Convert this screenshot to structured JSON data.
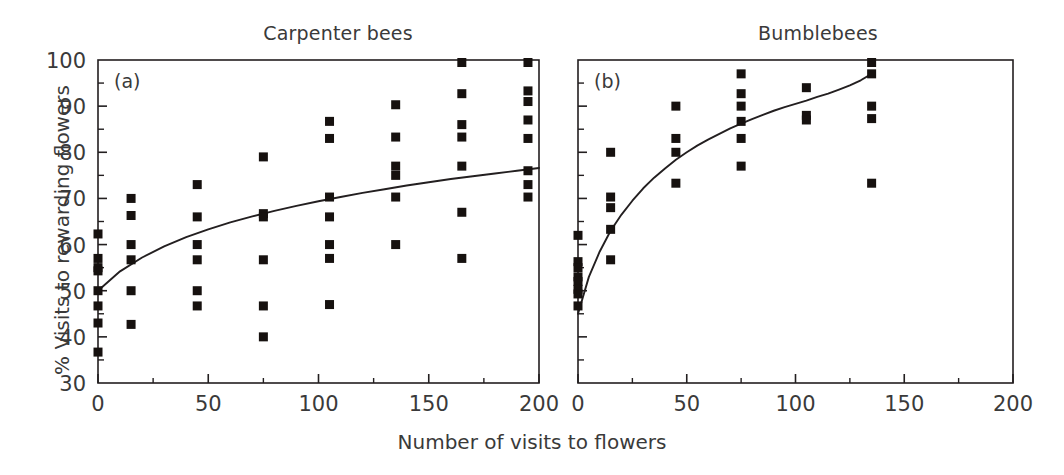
{
  "figure": {
    "xlabel": "Number of visits to flowers",
    "ylabel": "% Visits to rewarding flowers",
    "panel_a_title": "Carpenter bees",
    "panel_b_title": "Bumblebees",
    "panel_a_letter": "(a)",
    "panel_b_letter": "(b)",
    "marker_color": "#16110f",
    "axis_color": "#231f20",
    "text_color": "#3a3a3a",
    "background": "#ffffff"
  },
  "chart_data": [
    {
      "type": "scatter",
      "id": "panel-a",
      "title": "Carpenter bees",
      "panel_letter": "(a)",
      "xlabel": "Number of visits to flowers",
      "ylabel": "% Visits to rewarding flowers",
      "xlim": [
        0,
        200
      ],
      "ylim": [
        30,
        100
      ],
      "xticks": [
        0,
        50,
        100,
        150,
        200
      ],
      "xtick_labels": [
        "0",
        "50",
        "100",
        "150",
        "200"
      ],
      "xminor_step": 25,
      "yticks": [
        30,
        40,
        50,
        60,
        70,
        80,
        90,
        100
      ],
      "ytick_labels": [
        "30",
        "40",
        "50",
        "60",
        "70",
        "80",
        "90",
        "100"
      ],
      "yminor_step": 5,
      "grid": false,
      "legend": null,
      "marker": "filled-square",
      "points": [
        [
          0,
          62.3
        ],
        [
          0,
          57.0
        ],
        [
          0,
          55.0
        ],
        [
          0,
          54.3
        ],
        [
          0,
          50.0
        ],
        [
          0,
          46.7
        ],
        [
          0,
          43.0
        ],
        [
          0,
          36.7
        ],
        [
          15,
          70.0
        ],
        [
          15,
          66.3
        ],
        [
          15,
          60.0
        ],
        [
          15,
          56.7
        ],
        [
          15,
          50.0
        ],
        [
          15,
          42.7
        ],
        [
          45,
          73.0
        ],
        [
          45,
          66.0
        ],
        [
          45,
          60.0
        ],
        [
          45,
          56.7
        ],
        [
          45,
          50.0
        ],
        [
          45,
          46.7
        ],
        [
          75,
          79.0
        ],
        [
          75,
          66.7
        ],
        [
          75,
          66.0
        ],
        [
          75,
          56.7
        ],
        [
          75,
          46.7
        ],
        [
          75,
          40.0
        ],
        [
          105,
          86.7
        ],
        [
          105,
          83.0
        ],
        [
          105,
          70.3
        ],
        [
          105,
          66.0
        ],
        [
          105,
          60.0
        ],
        [
          105,
          57.0
        ],
        [
          105,
          47.0
        ],
        [
          135,
          90.3
        ],
        [
          135,
          83.3
        ],
        [
          135,
          77.0
        ],
        [
          135,
          75.0
        ],
        [
          135,
          70.3
        ],
        [
          135,
          60.0
        ],
        [
          165,
          100.0
        ],
        [
          165,
          92.7
        ],
        [
          165,
          86.0
        ],
        [
          165,
          83.3
        ],
        [
          165,
          77.0
        ],
        [
          165,
          67.0
        ],
        [
          165,
          57.0
        ],
        [
          195,
          100.0
        ],
        [
          195,
          93.3
        ],
        [
          195,
          91.0
        ],
        [
          195,
          87.0
        ],
        [
          195,
          83.0
        ],
        [
          195,
          76.0
        ],
        [
          195,
          73.0
        ],
        [
          195,
          70.3
        ]
      ],
      "fit_line": {
        "description": "logarithmic fit curve",
        "points": [
          [
            0,
            50.0
          ],
          [
            10,
            54.2
          ],
          [
            20,
            57.2
          ],
          [
            30,
            59.6
          ],
          [
            40,
            61.6
          ],
          [
            50,
            63.3
          ],
          [
            60,
            64.8
          ],
          [
            70,
            66.1
          ],
          [
            80,
            67.3
          ],
          [
            90,
            68.4
          ],
          [
            100,
            69.4
          ],
          [
            110,
            70.3
          ],
          [
            120,
            71.2
          ],
          [
            130,
            72.0
          ],
          [
            140,
            72.8
          ],
          [
            150,
            73.5
          ],
          [
            160,
            74.2
          ],
          [
            170,
            74.8
          ],
          [
            180,
            75.4
          ],
          [
            190,
            76.0
          ],
          [
            200,
            76.6
          ]
        ]
      }
    },
    {
      "type": "scatter",
      "id": "panel-b",
      "title": "Bumblebees",
      "panel_letter": "(b)",
      "xlabel": "Number of visits to flowers",
      "ylabel": "% Visits to rewarding flowers",
      "xlim": [
        0,
        200
      ],
      "ylim": [
        30,
        100
      ],
      "xticks": [
        0,
        50,
        100,
        150,
        200
      ],
      "xtick_labels": [
        "0",
        "50",
        "100",
        "150",
        "200"
      ],
      "xminor_step": 25,
      "yticks": [
        30,
        40,
        50,
        60,
        70,
        80,
        90,
        100
      ],
      "ytick_labels": [],
      "yminor_step": 5,
      "grid": false,
      "legend": null,
      "marker": "filled-square",
      "points": [
        [
          0,
          62.0
        ],
        [
          0,
          56.3
        ],
        [
          0,
          55.0
        ],
        [
          0,
          53.0
        ],
        [
          0,
          52.0
        ],
        [
          0,
          50.3
        ],
        [
          0,
          49.3
        ],
        [
          0,
          46.7
        ],
        [
          15,
          80.0
        ],
        [
          15,
          70.3
        ],
        [
          15,
          68.0
        ],
        [
          15,
          63.3
        ],
        [
          15,
          56.7
        ],
        [
          45,
          90.0
        ],
        [
          45,
          83.0
        ],
        [
          45,
          80.0
        ],
        [
          45,
          73.3
        ],
        [
          75,
          97.0
        ],
        [
          75,
          92.7
        ],
        [
          75,
          90.0
        ],
        [
          75,
          86.7
        ],
        [
          75,
          83.0
        ],
        [
          75,
          77.0
        ],
        [
          105,
          94.0
        ],
        [
          105,
          88.0
        ],
        [
          105,
          87.0
        ],
        [
          135,
          100.0
        ],
        [
          135,
          97.0
        ],
        [
          135,
          90.0
        ],
        [
          135,
          87.3
        ],
        [
          135,
          73.3
        ]
      ],
      "fit_line": {
        "description": "logarithmic saturating fit curve",
        "points": [
          [
            0,
            45.0
          ],
          [
            5,
            53.0
          ],
          [
            10,
            58.5
          ],
          [
            15,
            63.0
          ],
          [
            20,
            66.5
          ],
          [
            25,
            69.5
          ],
          [
            30,
            72.2
          ],
          [
            35,
            74.5
          ],
          [
            40,
            76.5
          ],
          [
            45,
            78.4
          ],
          [
            50,
            80.0
          ],
          [
            55,
            81.5
          ],
          [
            60,
            82.8
          ],
          [
            65,
            84.0
          ],
          [
            70,
            85.2
          ],
          [
            75,
            86.2
          ],
          [
            80,
            87.2
          ],
          [
            85,
            88.1
          ],
          [
            90,
            89.0
          ],
          [
            95,
            89.8
          ],
          [
            100,
            90.5
          ],
          [
            105,
            91.2
          ],
          [
            110,
            92.0
          ],
          [
            115,
            92.7
          ],
          [
            120,
            93.6
          ],
          [
            125,
            94.5
          ],
          [
            130,
            95.6
          ],
          [
            135,
            97.0
          ]
        ]
      }
    }
  ]
}
